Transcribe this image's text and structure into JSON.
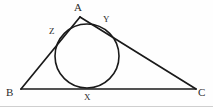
{
  "figure": {
    "kind": "incircle-triangle-diagram",
    "background_color": "#fefefe",
    "stroke_color": "#1a1a1a",
    "label_color": "#2b2b2b",
    "width": 213,
    "height": 107,
    "triangle": {
      "name": "triangle-ABC",
      "vertices": [
        {
          "id": "A",
          "label": "A",
          "x": 80,
          "y": 17
        },
        {
          "id": "B",
          "label": "B",
          "x": 21,
          "y": 89
        },
        {
          "id": "C",
          "label": "C",
          "x": 196,
          "y": 89
        }
      ],
      "sides": [
        {
          "id": "AB",
          "from": "A",
          "to": "B"
        },
        {
          "id": "AC",
          "from": "A",
          "to": "C"
        },
        {
          "id": "BC",
          "from": "B",
          "to": "C"
        }
      ]
    },
    "incircle": {
      "name": "inscribed-circle",
      "center_x": 87,
      "center_y": 56,
      "radius": 32
    },
    "tangent_points": [
      {
        "id": "X",
        "label": "X",
        "x": 87,
        "y": 88,
        "on_side": "BC"
      },
      {
        "id": "Y",
        "label": "Y",
        "x": 110,
        "y": 29,
        "on_side": "AC"
      },
      {
        "id": "Z",
        "label": "Z",
        "x": 62,
        "y": 35,
        "on_side": "AB"
      }
    ]
  }
}
